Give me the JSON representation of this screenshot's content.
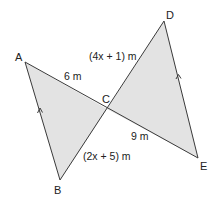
{
  "diagram": {
    "type": "geometry",
    "colors": {
      "fill": "#e3e3e3",
      "stroke": "#3a3a3a",
      "text": "#222222"
    },
    "vertices": {
      "A": {
        "label": "A",
        "x": 25,
        "y": 62
      },
      "B": {
        "label": "B",
        "x": 60,
        "y": 180
      },
      "C": {
        "label": "C",
        "x": 107,
        "y": 109
      },
      "D": {
        "label": "D",
        "x": 164,
        "y": 21
      },
      "E": {
        "label": "E",
        "x": 198,
        "y": 158
      }
    },
    "segment_labels": {
      "AC": "6 m",
      "CE": "9 m",
      "DC": "(4x + 1) m",
      "CB": "(2x + 5) m"
    },
    "parallel_marks": [
      "AB",
      "DE"
    ]
  }
}
